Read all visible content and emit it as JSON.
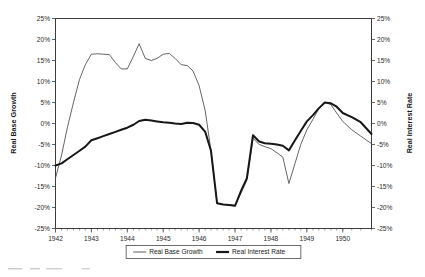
{
  "chart_data": {
    "type": "line",
    "title": "",
    "xlabel": "",
    "ylabel": "Real Base Growth",
    "y2label": "Real Interest Rate",
    "ylim": [
      -25,
      25
    ],
    "y2lim": [
      -25,
      25
    ],
    "xlim": [
      1942.0,
      1950.8
    ],
    "grid": false,
    "legend_position": "bottom",
    "ytick_labels": [
      "25%",
      "20%",
      "15%",
      "10%",
      "5%",
      "0%",
      "-5%",
      "-10%",
      "-15%",
      "-20%",
      "-25%"
    ],
    "ytick_values": [
      25,
      20,
      15,
      10,
      5,
      0,
      -5,
      -10,
      -15,
      -20,
      -25
    ],
    "y2tick_labels": [
      "25%",
      "20%",
      "15%",
      "10%",
      "5%",
      "0%",
      "-5%",
      "-10%",
      "-15%",
      "-20%",
      "-25%"
    ],
    "y2tick_values": [
      25,
      20,
      15,
      10,
      5,
      0,
      -5,
      -10,
      -15,
      -20,
      -25
    ],
    "xtick_labels": [
      "1942",
      "1943",
      "1944",
      "1945",
      "1946",
      "1947",
      "1948",
      "1949",
      "1950"
    ],
    "xtick_values": [
      1942,
      1943,
      1944,
      1945,
      1946,
      1947,
      1948,
      1949,
      1950
    ],
    "x": [
      1942.0,
      1942.17,
      1942.33,
      1942.5,
      1942.67,
      1942.83,
      1943.0,
      1943.17,
      1943.33,
      1943.5,
      1943.67,
      1943.83,
      1944.0,
      1944.17,
      1944.33,
      1944.5,
      1944.67,
      1944.83,
      1945.0,
      1945.17,
      1945.33,
      1945.5,
      1945.67,
      1945.83,
      1946.0,
      1946.17,
      1946.33,
      1946.5,
      1946.67,
      1946.83,
      1947.0,
      1947.17,
      1947.33,
      1947.5,
      1947.67,
      1947.83,
      1948.0,
      1948.17,
      1948.33,
      1948.5,
      1948.67,
      1948.83,
      1949.0,
      1949.17,
      1949.33,
      1949.5,
      1949.67,
      1949.83,
      1950.0,
      1950.25,
      1950.5,
      1950.8
    ],
    "series": [
      {
        "name": "Real Base Growth",
        "style": "thin",
        "values": [
          -13.0,
          -7.5,
          -1.0,
          5.0,
          10.5,
          14.0,
          16.5,
          16.6,
          16.5,
          16.4,
          14.5,
          13.0,
          13.0,
          16.0,
          19.0,
          15.5,
          15.0,
          15.5,
          16.5,
          16.7,
          15.5,
          14.0,
          13.8,
          12.5,
          9.0,
          3.0,
          -6.5,
          -19.0,
          -19.3,
          -19.3,
          -19.5,
          -16.5,
          -13.5,
          -3.5,
          -5.0,
          -5.5,
          -6.0,
          -7.0,
          -8.0,
          -14.3,
          -9.5,
          -5.0,
          -1.5,
          1.0,
          3.5,
          5.0,
          4.5,
          2.5,
          0.5,
          -1.5,
          -3.0,
          -4.8
        ]
      },
      {
        "name": "Real Interest Rate",
        "style": "thick",
        "values": [
          -10.0,
          -9.5,
          -8.5,
          -7.5,
          -6.5,
          -5.5,
          -4.0,
          -3.5,
          -3.0,
          -2.5,
          -2.0,
          -1.5,
          -1.0,
          -0.3,
          0.6,
          0.9,
          0.7,
          0.5,
          0.3,
          0.2,
          0.0,
          -0.1,
          0.2,
          0.1,
          -0.3,
          -2.0,
          -6.5,
          -19.0,
          -19.3,
          -19.4,
          -19.6,
          -16.0,
          -13.0,
          -2.8,
          -4.3,
          -4.7,
          -4.8,
          -5.0,
          -5.3,
          -6.4,
          -4.0,
          -1.8,
          0.5,
          2.0,
          3.6,
          5.0,
          4.8,
          4.0,
          2.5,
          1.5,
          0.3,
          -2.5
        ]
      }
    ]
  },
  "legend": {
    "items": [
      {
        "label": "Real Base Growth",
        "style": "thin"
      },
      {
        "label": "Real Interest Rate",
        "style": "thick"
      }
    ]
  },
  "caption": {
    "text": ""
  },
  "colors": {
    "thin_series": "#4a4a4a",
    "thick_series": "#171717",
    "frame": "#3d3d3d",
    "background": "#ffffff"
  }
}
